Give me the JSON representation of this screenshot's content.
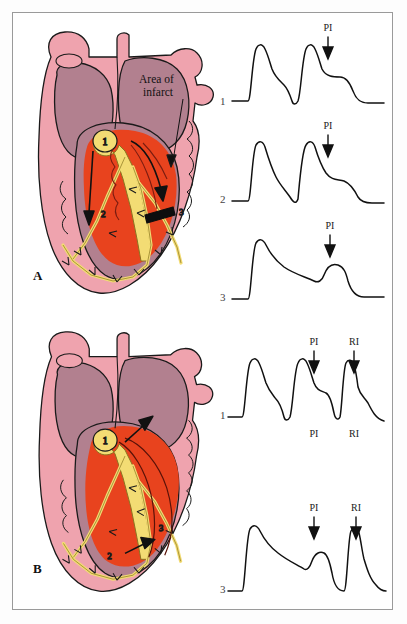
{
  "figure": {
    "colors": {
      "myocardium_pink": "#EFA3AE",
      "chamber_mauve": "#B2808F",
      "infarct_orange": "#E8431E",
      "conduction_yellow": "#F3DC74",
      "outline": "#1a1a1a",
      "frame": "#9a9a9a",
      "background": "#ffffff"
    }
  },
  "panels": [
    {
      "id": "A",
      "letter": "A",
      "heart": {
        "annotation": "Area of infarct",
        "annotation_line1": "Area of",
        "annotation_line2": "infarct",
        "markers": [
          {
            "id": "1",
            "label": "1",
            "meaning": "sinus-impulse-origin"
          },
          {
            "id": "2",
            "label": "2",
            "meaning": "normal-conduction-pathway"
          },
          {
            "id": "3",
            "label": "3",
            "meaning": "unidirectional-block"
          }
        ],
        "block_present": true
      },
      "traces": [
        {
          "number": "1",
          "labels_above": [
            "PI"
          ],
          "labels_below": [],
          "beats": 2,
          "description": "normal action potentials; premature impulse conducts with shortened plateau"
        },
        {
          "number": "2",
          "labels_above": [
            "PI"
          ],
          "labels_below": [],
          "beats": 2,
          "description": "premature impulse produces sharp deep deflection then recovery"
        },
        {
          "number": "3",
          "labels_above": [
            "PI"
          ],
          "labels_below": [],
          "beats": 1,
          "description": "premature impulse produces only a small local hump, blocked"
        }
      ]
    },
    {
      "id": "B",
      "letter": "B",
      "heart": {
        "annotation": "",
        "annotation_line1": "",
        "annotation_line2": "",
        "markers": [
          {
            "id": "1",
            "label": "1",
            "meaning": "retrograde-impulse-to-atrium"
          },
          {
            "id": "2",
            "label": "2",
            "meaning": "slow-conduction-limb"
          },
          {
            "id": "3",
            "label": "3",
            "meaning": "reentry-loop-exit"
          }
        ],
        "block_present": false
      },
      "traces": [
        {
          "number": "1",
          "labels_above": [
            "PI",
            "RI"
          ],
          "labels_below": [
            "PI",
            "RI"
          ],
          "beats": 3,
          "description": "premature impulse followed by reentrant impulse"
        },
        {
          "number": "3",
          "labels_above": [
            "PI",
            "RI"
          ],
          "labels_below": [],
          "beats": 2,
          "description": "small premature hump then narrow reentrant action potential"
        }
      ]
    }
  ],
  "legend": {
    "PI": "PI",
    "RI": "RI",
    "PI_meaning": "premature impulse",
    "RI_meaning": "reentrant impulse"
  }
}
